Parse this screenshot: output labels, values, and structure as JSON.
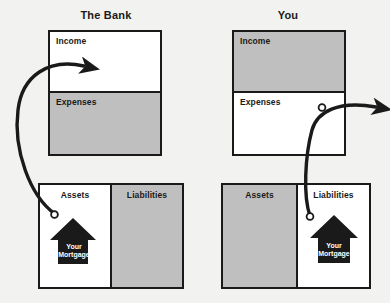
{
  "figure": {
    "background_color": "#f2f2f0",
    "line_color": "#1a1a1a",
    "shade_color": "#bfbfbf",
    "fill_color": "#ffffff"
  },
  "panels": [
    {
      "id": "bank",
      "title": "The Bank",
      "income_statement": {
        "rows": [
          {
            "label": "Income",
            "shaded": false
          },
          {
            "label": "Expenses",
            "shaded": true
          }
        ]
      },
      "balance_sheet": {
        "columns": [
          {
            "label": "Assets",
            "shaded": false
          },
          {
            "label": "Liabilities",
            "shaded": true
          }
        ]
      },
      "house": {
        "label_line1": "Your",
        "label_line2": "Mortgage",
        "placed_in": "Assets"
      },
      "flow": {
        "from": "Assets",
        "to": "Income",
        "direction": "inbound",
        "start_marker": "circle",
        "end_marker": "arrowhead"
      }
    },
    {
      "id": "you",
      "title": "You",
      "income_statement": {
        "rows": [
          {
            "label": "Income",
            "shaded": true
          },
          {
            "label": "Expenses",
            "shaded": false
          }
        ]
      },
      "balance_sheet": {
        "columns": [
          {
            "label": "Assets",
            "shaded": true
          },
          {
            "label": "Liabilities",
            "shaded": false
          }
        ]
      },
      "house": {
        "label_line1": "Your",
        "label_line2": "Mortgage",
        "placed_in": "Liabilities"
      },
      "flow": {
        "from": "Liabilities",
        "to": "Expenses",
        "direction": "outbound",
        "start_marker": "circle",
        "end_marker": "arrowhead"
      }
    }
  ]
}
